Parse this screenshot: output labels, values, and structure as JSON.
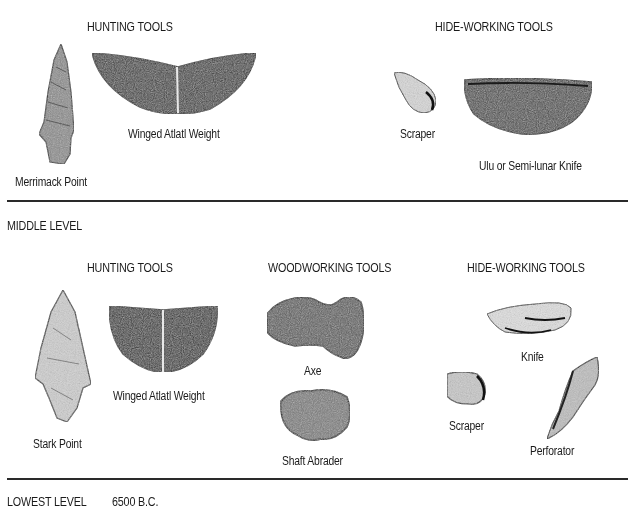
{
  "upper_level": {
    "groups": [
      {
        "heading": "HUNTING TOOLS",
        "artifacts": [
          {
            "name": "Merrimack Point"
          },
          {
            "name": "Winged Atlatl Weight"
          }
        ]
      },
      {
        "heading": "HIDE-WORKING TOOLS",
        "artifacts": [
          {
            "name": "Scraper"
          },
          {
            "name": "Ulu or Semi-lunar Knife"
          }
        ]
      }
    ]
  },
  "middle_level": {
    "label": "MIDDLE LEVEL",
    "groups": [
      {
        "heading": "HUNTING TOOLS",
        "artifacts": [
          {
            "name": "Stark Point"
          },
          {
            "name": "Winged Atlatl Weight"
          }
        ]
      },
      {
        "heading": "WOODWORKING TOOLS",
        "artifacts": [
          {
            "name": "Axe"
          },
          {
            "name": "Shaft Abrader"
          }
        ]
      },
      {
        "heading": "HIDE-WORKING TOOLS",
        "artifacts": [
          {
            "name": "Knife"
          },
          {
            "name": "Scraper"
          },
          {
            "name": "Perforator"
          }
        ]
      }
    ]
  },
  "lowest_level": {
    "label": "LOWEST LEVEL",
    "date": "6500 B.C."
  },
  "colors": {
    "ink": "#1a1a1a",
    "stone_dark": "#2b2b2b",
    "stone_mid": "#6e6e6e",
    "stone_light": "#d8d8d8",
    "background": "#ffffff"
  }
}
